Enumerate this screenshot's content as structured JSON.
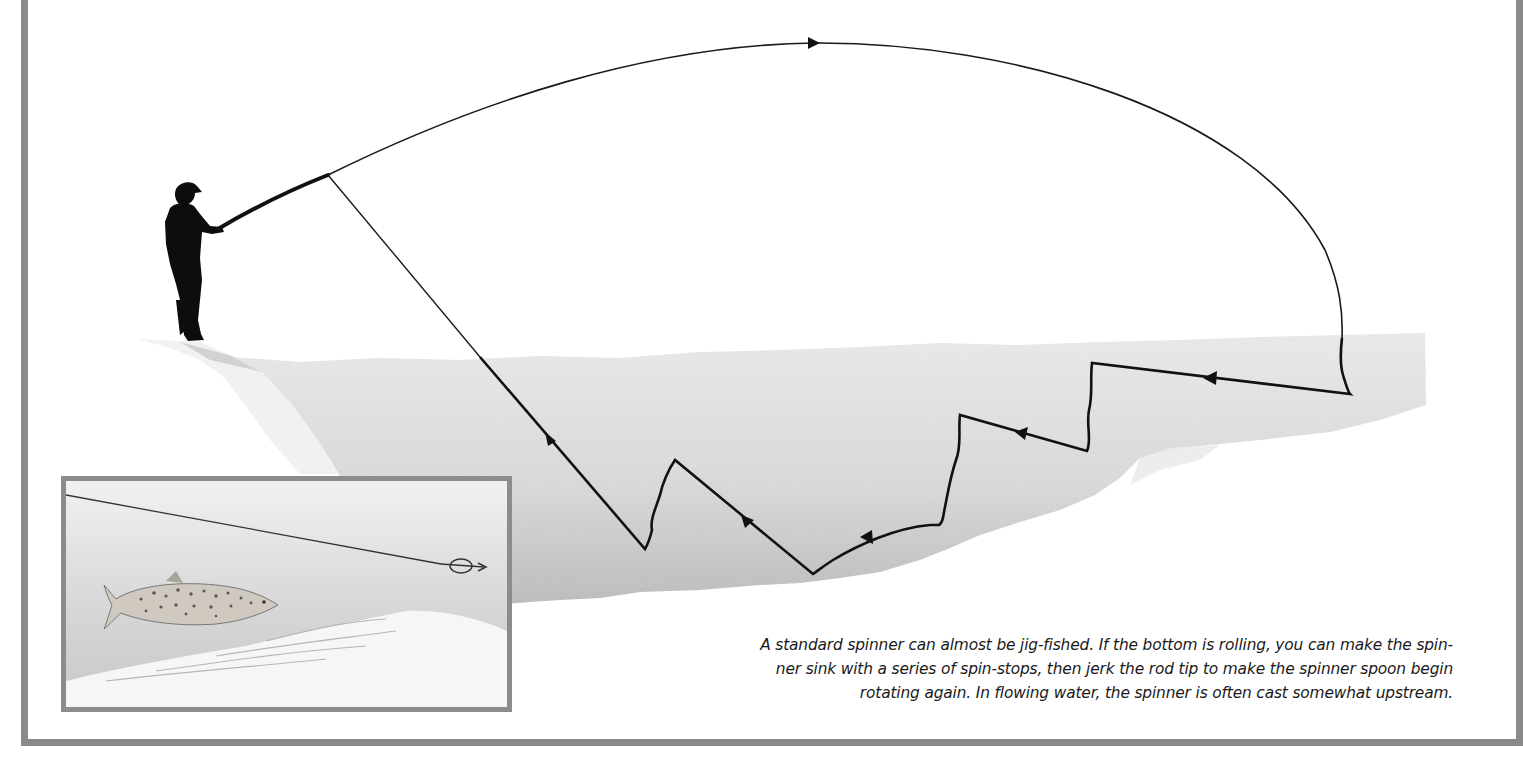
{
  "figure": {
    "caption_lines": [
      "A standard spinner can almost be jig-fished. If the bottom is rolling, you can make the spin-",
      "ner sink with a series of spin-stops, then jerk the rod tip to make the spinner spoon begin",
      "rotating again. In flowing water, the spinner is often cast somewhat upstream."
    ],
    "elements": {
      "angler": "silhouette-angler-with-rod",
      "cast_arc": "overhead-cast-trajectory",
      "retrieve_path": "zigzag-spin-stop-retrieve",
      "water": "river-water-wash",
      "inset": "trout-following-spinner"
    },
    "direction_arrows": 7,
    "colors": {
      "frame": "#8a8a8a",
      "inset_border": "#8c8c8c",
      "line": "#111111",
      "water_light": "#e6e6e6",
      "water_dark": "#b5b5b5",
      "text": "#1a1a1a"
    }
  }
}
